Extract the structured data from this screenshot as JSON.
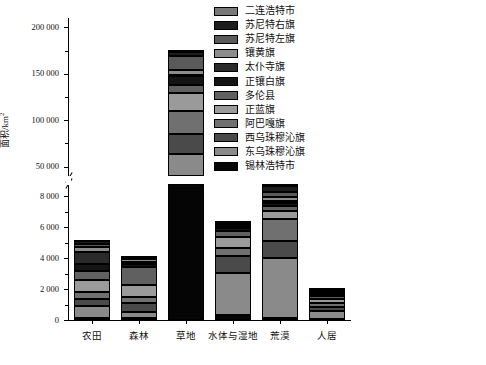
{
  "chart_data": {
    "type": "bar",
    "subtype": "stacked-bar-with-broken-y-axis",
    "title": "",
    "xlabel": "",
    "ylabel": "面积/km²",
    "categories": [
      "农田",
      "森林",
      "草地",
      "水体与湿地",
      "荒漠",
      "人居"
    ],
    "legend_position": "top-right",
    "grid": false,
    "y_axis": {
      "broken": true,
      "lower_range": [
        0,
        8800
      ],
      "lower_ticks": [
        0,
        2000,
        4000,
        6000,
        8000
      ],
      "lower_tick_labels": [
        "0",
        "2 000",
        "4 000",
        "6 000",
        "8 000"
      ],
      "lower_minor_ticks": [
        1000,
        3000,
        5000,
        7000
      ],
      "upper_range": [
        40000,
        210000
      ],
      "upper_ticks": [
        50000,
        100000,
        150000,
        200000
      ],
      "upper_tick_labels": [
        "50 000",
        "100 000",
        "150 000",
        "200 000"
      ],
      "upper_minor_ticks": [
        75000,
        125000,
        175000
      ]
    },
    "series": [
      {
        "name": "二连浩特市",
        "color": "#787878",
        "values": [
          120,
          60,
          1850,
          40,
          180,
          35
        ]
      },
      {
        "name": "苏尼特右旗",
        "color": "#1c1c1c",
        "values": [
          180,
          40,
          4600,
          70,
          420,
          60
        ]
      },
      {
        "name": "苏尼特左旗",
        "color": "#5a5a5a",
        "values": [
          150,
          55,
          14800,
          90,
          300,
          50
        ]
      },
      {
        "name": "镶黄旗",
        "color": "#8c8c8c",
        "values": [
          360,
          210,
          4900,
          140,
          250,
          120
        ]
      },
      {
        "name": "太仆寺旗",
        "color": "#2a2a2a",
        "values": [
          760,
          130,
          2100,
          120,
          130,
          160
        ]
      },
      {
        "name": "正镶白旗",
        "color": "#141414",
        "values": [
          430,
          180,
          9700,
          170,
          210,
          130
        ]
      },
      {
        "name": "多伦县",
        "color": "#606060",
        "values": [
          620,
          1150,
          7900,
          430,
          340,
          150
        ]
      },
      {
        "name": "正蓝旗",
        "color": "#9a9a9a",
        "values": [
          780,
          820,
          19200,
          700,
          520,
          300
        ]
      },
      {
        "name": "阿巴嘎旗",
        "color": "#707070",
        "values": [
          430,
          380,
          25600,
          540,
          1450,
          250
        ]
      },
      {
        "name": "西乌珠穆沁旗",
        "color": "#4a4a4a",
        "values": [
          480,
          560,
          21500,
          1100,
          1050,
          240
        ]
      },
      {
        "name": "东乌珠穆沁旗",
        "color": "#8a8a8a",
        "values": [
          760,
          420,
          44500,
          2700,
          3900,
          520
        ]
      },
      {
        "name": "锡林浩特市",
        "color": "#050505",
        "values": [
          130,
          105,
          18700,
          320,
          130,
          70
        ]
      }
    ]
  },
  "legend": {
    "items": [
      {
        "label": "二连浩特市",
        "color": "#787878"
      },
      {
        "label": "苏尼特右旗",
        "color": "#1c1c1c"
      },
      {
        "label": "苏尼特左旗",
        "color": "#5a5a5a"
      },
      {
        "label": "镶黄旗",
        "color": "#8c8c8c"
      },
      {
        "label": "太仆寺旗",
        "color": "#2a2a2a"
      },
      {
        "label": "正镶白旗",
        "color": "#141414"
      },
      {
        "label": "多伦县",
        "color": "#606060"
      },
      {
        "label": "正蓝旗",
        "color": "#9a9a9a"
      },
      {
        "label": "阿巴嘎旗",
        "color": "#707070"
      },
      {
        "label": "西乌珠穆沁旗",
        "color": "#4a4a4a"
      },
      {
        "label": "东乌珠穆沁旗",
        "color": "#8a8a8a"
      },
      {
        "label": "锡林浩特市",
        "color": "#050505"
      }
    ]
  },
  "axis": {
    "y_title_main": "面积/km",
    "y_title_sup": "2"
  }
}
